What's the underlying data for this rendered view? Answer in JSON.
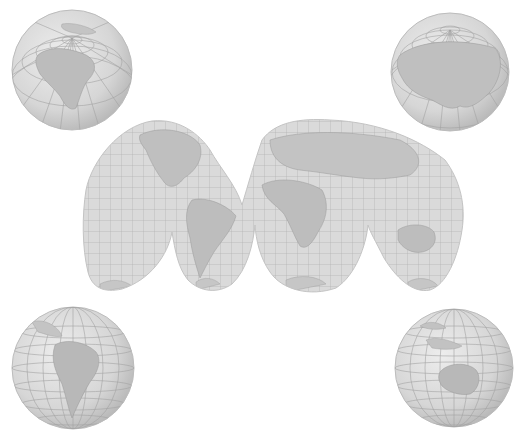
{
  "figure": {
    "type": "interrupted world map projection with four orthographic globes",
    "background": "#ffffff",
    "land_color": "#bdbdbd",
    "ocean_color": "#dcdcdc",
    "graticule_color": "#9a9a9a",
    "outline_color": "#b8b8b8"
  },
  "globes": [
    {
      "id": "north-america",
      "region": "North America / North Pole",
      "cx": 72,
      "cy": 70,
      "r": 60
    },
    {
      "id": "eurasia",
      "region": "Eurasia / North Pole",
      "cx": 450,
      "cy": 72,
      "r": 59
    },
    {
      "id": "south-america",
      "region": "South America",
      "cx": 73,
      "cy": 368,
      "r": 61
    },
    {
      "id": "australia",
      "region": "Australia / Southeast Asia",
      "cx": 454,
      "cy": 368,
      "r": 59
    }
  ],
  "world_map": {
    "projection": "interrupted (Goode-style) lobes",
    "lobes": [
      "Americas north",
      "South America",
      "Africa",
      "Eurasia/Australia"
    ],
    "bounds": {
      "x": 82,
      "y": 120,
      "width": 380,
      "height": 172
    }
  }
}
